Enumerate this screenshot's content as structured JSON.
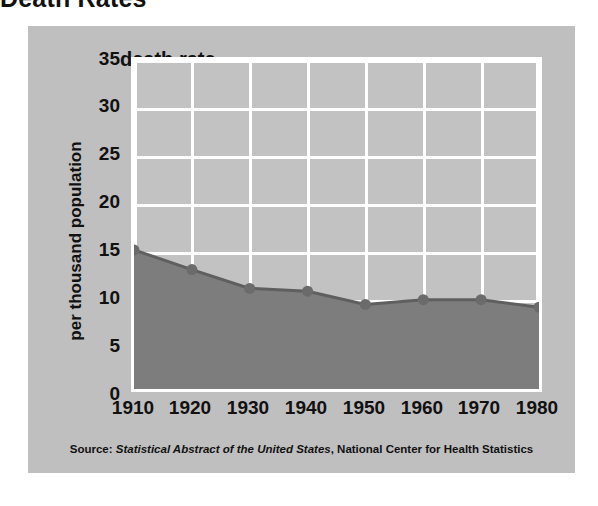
{
  "page": {
    "title": "Death Rates"
  },
  "figure": {
    "header_label": "death rate",
    "y_axis_title": "per thousand population",
    "source": {
      "prefix": "Source:",
      "publication": "Statistical Abstract of the United States",
      "suffix": ", National Center for Health Statistics"
    },
    "colors": {
      "panel_background": "#bfbfbf",
      "plot_background": "#c2c2c2",
      "gridline": "#ffffff",
      "area_fill": "#7d7d7d",
      "line": "#5f5f5f",
      "marker": "#6b6b6b",
      "text": "#111111"
    }
  },
  "chart_data": {
    "type": "area",
    "title": "Death Rates",
    "subtitle": "death rate",
    "xlabel": "",
    "ylabel": "per thousand population",
    "x": [
      1910,
      1920,
      1930,
      1940,
      1950,
      1960,
      1970,
      1980
    ],
    "categories": [
      "1910",
      "1920",
      "1930",
      "1940",
      "1950",
      "1960",
      "1970",
      "1980"
    ],
    "values": [
      14.8,
      12.7,
      10.7,
      10.4,
      9.0,
      9.5,
      9.5,
      8.7
    ],
    "series": [
      {
        "name": "death rate per thousand population",
        "values": [
          14.8,
          12.7,
          10.7,
          10.4,
          9.0,
          9.5,
          9.5,
          8.7
        ]
      }
    ],
    "xlim": [
      1910,
      1980
    ],
    "ylim": [
      0,
      35
    ],
    "yticks": [
      0,
      5,
      10,
      15,
      20,
      25,
      30,
      35
    ],
    "ytick_labels": [
      "0",
      "5",
      "10",
      "15",
      "20",
      "25",
      "30",
      "35"
    ],
    "xticks": [
      1910,
      1920,
      1930,
      1940,
      1950,
      1960,
      1970,
      1980
    ],
    "xtick_labels": [
      "1910",
      "1920",
      "1930",
      "1940",
      "1950",
      "1960",
      "1970",
      "1980"
    ],
    "grid": true,
    "grid_orientation": "both",
    "legend": false,
    "legend_position": "none",
    "markers": true,
    "annotations": [
      "Source: Statistical Abstract of the United States, National Center for Health Statistics"
    ]
  }
}
